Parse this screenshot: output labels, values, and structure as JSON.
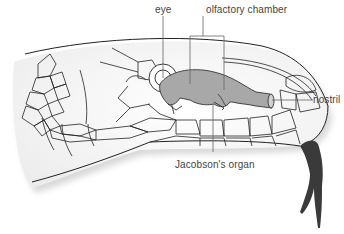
{
  "diagram": {
    "labels": {
      "eye": "eye",
      "olfactory_chamber": "olfactory chamber",
      "nostril": "nostril",
      "jacobsons_organ": "Jacobson's organ"
    },
    "colors": {
      "outline": "#222222",
      "organ_fill": "#a8a8a8",
      "tongue": "#3a3a3a",
      "leader_line": "#666666",
      "head_shade": "#f4f4f4"
    }
  }
}
